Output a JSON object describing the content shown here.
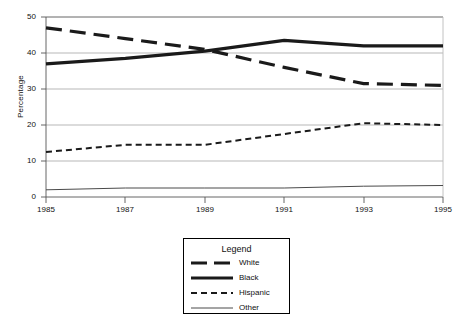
{
  "chart_data": {
    "type": "line",
    "title": "",
    "xlabel": "",
    "ylabel": "Percentage",
    "xlim": [
      1985,
      1995
    ],
    "ylim": [
      0,
      50
    ],
    "yticks": [
      0,
      10,
      20,
      30,
      40,
      50
    ],
    "xticks": [
      1985,
      1987,
      1989,
      1991,
      1993,
      1995
    ],
    "grid": true,
    "legend": {
      "title": "Legend",
      "position": "below-center",
      "entries": [
        "White",
        "Black",
        "Hispanic",
        "Other"
      ]
    },
    "x": [
      1985,
      1987,
      1989,
      1991,
      1993,
      1995
    ],
    "series": [
      {
        "name": "White",
        "style": "long-dash",
        "width": 3,
        "color": "#1a1a1a",
        "values": [
          47,
          44,
          41,
          36,
          31.5,
          31
        ]
      },
      {
        "name": "Black",
        "style": "solid-thick",
        "width": 3,
        "color": "#1a1a1a",
        "values": [
          37,
          38.5,
          40.5,
          43.5,
          42,
          42
        ]
      },
      {
        "name": "Hispanic",
        "style": "short-dash",
        "width": 2,
        "color": "#1a1a1a",
        "values": [
          12.5,
          14.5,
          14.5,
          17.5,
          20.5,
          20
        ]
      },
      {
        "name": "Other",
        "style": "solid-thin",
        "width": 1,
        "color": "#4a4a4a",
        "values": [
          2,
          2.5,
          2.5,
          2.5,
          3,
          3.2
        ]
      }
    ]
  },
  "axis": {
    "y_title": "Percentage",
    "y_tick_labels": [
      "50",
      "40",
      "30",
      "20",
      "10",
      "0"
    ],
    "x_tick_labels": [
      "1985",
      "1987",
      "1989",
      "1991",
      "1993",
      "1995"
    ]
  },
  "legend": {
    "title": "Legend",
    "items": [
      {
        "label": "White"
      },
      {
        "label": "Black"
      },
      {
        "label": "Hispanic"
      },
      {
        "label": "Other"
      }
    ]
  },
  "colors": {
    "line": "#1a1a1a",
    "thin_line": "#4a4a4a",
    "grid": "#9a9a9a",
    "axis": "#555555",
    "background": "#ffffff"
  }
}
